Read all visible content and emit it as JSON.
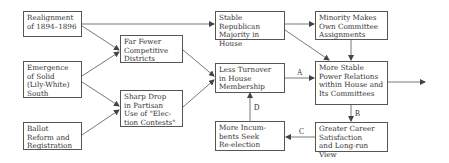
{
  "diagram": {
    "nodes": [
      {
        "id": "realignment",
        "label": "Realignment\nof 1894–1896"
      },
      {
        "id": "emergence",
        "label": "Emergence\nof Solid\n(Lily-White)\nSouth"
      },
      {
        "id": "ballot",
        "label": "Ballot\nReform and\nRegistration"
      },
      {
        "id": "fewer",
        "label": "Far Fewer\nCompetitive\nDistricts"
      },
      {
        "id": "sharp",
        "label": "Sharp Drop\nin Partisan\nUse of \"Elec-\ntion Contests\""
      },
      {
        "id": "stable_rep",
        "label": "Stable Republican\nMajority in\nHouse"
      },
      {
        "id": "turnover",
        "label": "Less Turnover\nin House\nMembership"
      },
      {
        "id": "incumbents",
        "label": "More Incum-\nbents Seek\nRe-election"
      },
      {
        "id": "minority",
        "label": "Minority Makes\nOwn Committee\nAssignments"
      },
      {
        "id": "power",
        "label": "More Stable\nPower Relations\nwithin House and\nIts Committees"
      },
      {
        "id": "career",
        "label": "Greater Career\nSatisfaction\nand Long-run View"
      }
    ],
    "edge_labels": {
      "a": "A",
      "b": "B",
      "c": "C",
      "d": "D"
    },
    "edges": [
      {
        "from": "realignment",
        "to": "stable_rep"
      },
      {
        "from": "realignment",
        "to": "fewer"
      },
      {
        "from": "emergence",
        "to": "fewer"
      },
      {
        "from": "emergence",
        "to": "sharp"
      },
      {
        "from": "ballot",
        "to": "sharp"
      },
      {
        "from": "fewer",
        "to": "turnover"
      },
      {
        "from": "sharp",
        "to": "turnover"
      },
      {
        "from": "stable_rep",
        "to": "minority"
      },
      {
        "from": "stable_rep",
        "to": "power"
      },
      {
        "from": "minority",
        "to": "power"
      },
      {
        "from": "turnover",
        "to": "power",
        "label": "A"
      },
      {
        "from": "power",
        "to": "career",
        "label": "B"
      },
      {
        "from": "career",
        "to": "incumbents",
        "label": "C"
      },
      {
        "from": "incumbents",
        "to": "turnover",
        "label": "D"
      },
      {
        "from": "power",
        "to": "outside"
      }
    ]
  }
}
